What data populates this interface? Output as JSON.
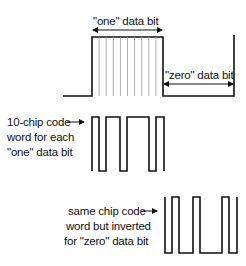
{
  "labels": {
    "one_bit": "\"one\" data bit",
    "zero_bit": "\"zero\" data bit",
    "code_word_line1": "10-chip code",
    "code_word_line2": "word for each",
    "code_word_line3": "\"one\" data bit",
    "inverted_line1": "same chip code",
    "inverted_line2": "word but inverted",
    "inverted_line3": "for \"zero\" data bit"
  },
  "chip_code": [
    1,
    0,
    1,
    1,
    0,
    1,
    1,
    1,
    0,
    1
  ],
  "chips_per_bit": 10,
  "colors": {
    "stroke": "#111111",
    "chip_divider": "#9a9a9a",
    "background": "#ffffff"
  }
}
